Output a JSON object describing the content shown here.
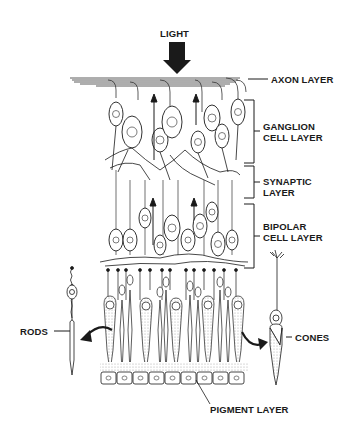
{
  "diagram": {
    "type": "retina-cross-section",
    "labels": {
      "light": "LIGHT",
      "axon_layer": "AXON LAYER",
      "ganglion_1": "GANGLION",
      "ganglion_2": "CELL LAYER",
      "synaptic_1": "SYNAPTIC",
      "synaptic_2": "LAYER",
      "bipolar_1": "BIPOLAR",
      "bipolar_2": "CELL LAYER",
      "rods": "RODS",
      "cones": "CONES",
      "pigment_layer": "PIGMENT LAYER"
    },
    "layers_top_to_bottom": [
      "Axon layer",
      "Ganglion cell layer",
      "Synaptic layer",
      "Bipolar cell layer",
      "Rods and cones",
      "Pigment layer"
    ],
    "colors": {
      "ink": "#1a1a1a",
      "background": "#ffffff",
      "stipple": "#bdbdbd"
    }
  }
}
